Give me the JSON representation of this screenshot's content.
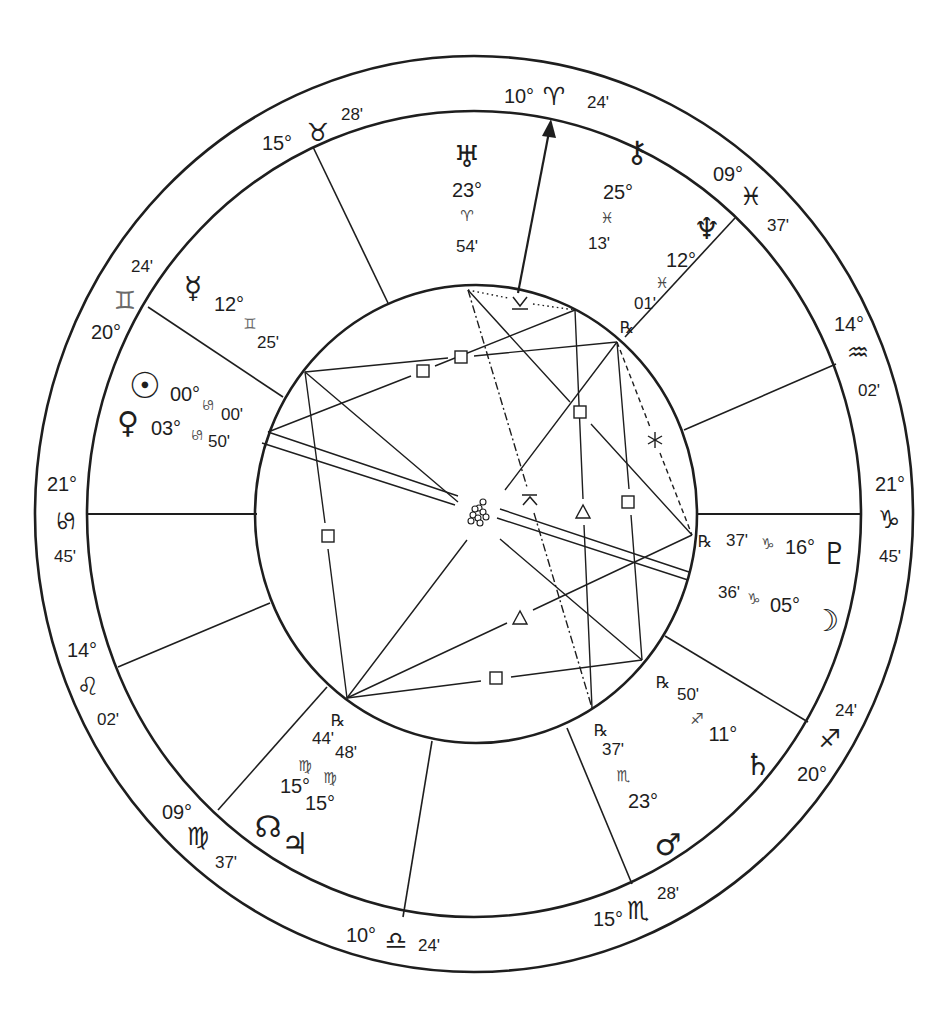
{
  "houses": {
    "mc": {
      "deg": "10°",
      "sign": "♈︎",
      "min": "24'"
    },
    "h11": {
      "deg": "15°",
      "sign": "♉︎",
      "min": "28'"
    },
    "h12": {
      "deg": "20°",
      "sign": "♊︎",
      "min": "24'"
    },
    "asc": {
      "deg": "21°",
      "sign": "♋︎",
      "min": "45'"
    },
    "h2": {
      "deg": "14°",
      "sign": "♌︎",
      "min": "02'"
    },
    "h3": {
      "deg": "09°",
      "sign": "♍︎",
      "min": "37'"
    },
    "ic": {
      "deg": "10°",
      "sign": "♎︎",
      "min": "24'"
    },
    "h5": {
      "deg": "15°",
      "sign": "♏︎",
      "min": "28'"
    },
    "h6": {
      "deg": "20°",
      "sign": "♐︎",
      "min": "24'"
    },
    "dsc": {
      "deg": "21°",
      "sign": "♑︎",
      "min": "45'"
    },
    "h8": {
      "deg": "14°",
      "sign": "♒︎",
      "min": "02'"
    },
    "h9": {
      "deg": "09°",
      "sign": "♓︎",
      "min": "37'"
    }
  },
  "planets": {
    "uranus": {
      "glyph": "♅︎",
      "deg": "23°",
      "sign": "♈︎",
      "min": "54'"
    },
    "chiron": {
      "glyph": "⚷︎",
      "deg": "25°",
      "sign": "♓︎",
      "min": "13'"
    },
    "neptune": {
      "glyph": "♆︎",
      "deg": "12°",
      "sign": "♓︎",
      "min": "01'",
      "retro": "℞"
    },
    "pluto": {
      "glyph": "♇︎",
      "deg": "16°",
      "sign": "♑︎",
      "min": "37'",
      "retro": "℞"
    },
    "moon": {
      "glyph": "☽︎",
      "deg": "05°",
      "sign": "♑︎",
      "min": "36'"
    },
    "saturn": {
      "glyph": "♄︎",
      "deg": "11°",
      "sign": "♐︎",
      "min": "50'",
      "retro": "℞"
    },
    "mars": {
      "glyph": "♂︎",
      "deg": "23°",
      "sign": "♏︎",
      "min": "37'",
      "retro": "℞"
    },
    "node": {
      "glyph": "☊︎",
      "deg": "15°",
      "sign": "♍︎",
      "min": "44'",
      "retro": "℞"
    },
    "jupiter": {
      "glyph": "♃︎",
      "deg": "15°",
      "sign": "♍︎",
      "min": "48'"
    },
    "mercury": {
      "glyph": "☿︎",
      "deg": "12°",
      "sign": "♊︎",
      "min": "25'"
    },
    "sun": {
      "glyph": "☉︎",
      "deg": "00°",
      "sign": "♋︎",
      "min": "00'"
    },
    "venus": {
      "glyph": "♀︎",
      "deg": "03°",
      "sign": "♋︎",
      "min": "50'"
    }
  },
  "aspects": [
    {
      "from": "uranus",
      "to": "chiron",
      "type": "semisextile"
    },
    {
      "from": "uranus",
      "to": "mars",
      "type": "quincunx"
    },
    {
      "from": "uranus",
      "to": "pluto",
      "type": "square"
    },
    {
      "from": "chiron",
      "to": "sun",
      "type": "square"
    },
    {
      "from": "chiron",
      "to": "mars",
      "type": "trine"
    },
    {
      "from": "neptune",
      "to": "mercury",
      "type": "square"
    },
    {
      "from": "neptune",
      "to": "jupiter",
      "type": "opposition"
    },
    {
      "from": "neptune",
      "to": "saturn",
      "type": "square"
    },
    {
      "from": "neptune",
      "to": "pluto",
      "type": "sextile"
    },
    {
      "from": "mercury",
      "to": "jupiter",
      "type": "square"
    },
    {
      "from": "mercury",
      "to": "saturn",
      "type": "opposition"
    },
    {
      "from": "sun",
      "to": "moon",
      "type": "opposition"
    },
    {
      "from": "venus",
      "to": "moon",
      "type": "opposition"
    },
    {
      "from": "jupiter",
      "to": "pluto",
      "type": "trine"
    },
    {
      "from": "jupiter",
      "to": "saturn",
      "type": "square"
    }
  ]
}
